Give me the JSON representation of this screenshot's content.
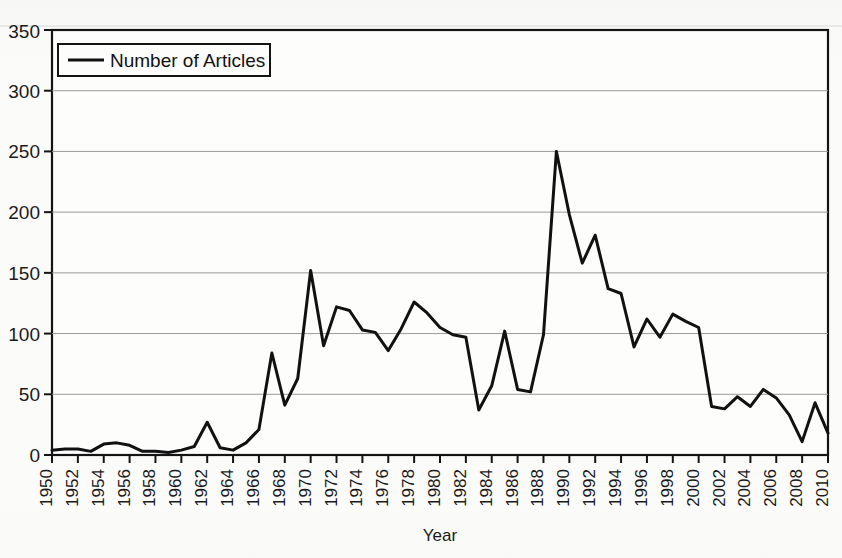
{
  "document": {
    "background_color": "#fbfbfa",
    "ink_color": "#111111",
    "gridline_color": "#9a9a9a"
  },
  "chart_data": {
    "type": "line",
    "title": "",
    "xlabel": "Year",
    "ylabel": "",
    "ylim": [
      0,
      350
    ],
    "xlim": [
      1950,
      2010
    ],
    "ytick_step": 50,
    "xtick_step": 2,
    "grid": "horizontal",
    "legend_position": "top-left-inside",
    "yticks": [
      "0",
      "50",
      "100",
      "150",
      "200",
      "250",
      "300",
      "350"
    ],
    "xticks": [
      "1950",
      "1952",
      "1954",
      "1956",
      "1958",
      "1960",
      "1962",
      "1964",
      "1966",
      "1968",
      "1970",
      "1972",
      "1974",
      "1976",
      "1978",
      "1980",
      "1982",
      "1984",
      "1986",
      "1988",
      "1990",
      "1992",
      "1994",
      "1996",
      "1998",
      "2000",
      "2002",
      "2004",
      "2006",
      "2008",
      "2010"
    ],
    "series": [
      {
        "name": "Number of Articles",
        "color": "#111111",
        "x": [
          1950,
          1951,
          1952,
          1953,
          1954,
          1955,
          1956,
          1957,
          1958,
          1959,
          1960,
          1961,
          1962,
          1963,
          1964,
          1965,
          1966,
          1967,
          1968,
          1969,
          1970,
          1971,
          1972,
          1973,
          1974,
          1975,
          1976,
          1977,
          1978,
          1979,
          1980,
          1981,
          1982,
          1983,
          1984,
          1985,
          1986,
          1987,
          1988,
          1989,
          1990,
          1991,
          1992,
          1993,
          1994,
          1995,
          1996,
          1997,
          1998,
          1999,
          2000,
          2001,
          2002,
          2003,
          2004,
          2005,
          2006,
          2007,
          2008,
          2009,
          2010
        ],
        "values": [
          4,
          5,
          5,
          3,
          9,
          10,
          8,
          3,
          3,
          2,
          4,
          7,
          27,
          6,
          4,
          10,
          21,
          84,
          41,
          63,
          152,
          90,
          122,
          119,
          103,
          101,
          86,
          104,
          126,
          117,
          105,
          99,
          97,
          37,
          57,
          102,
          54,
          52,
          99,
          250,
          198,
          158,
          181,
          137,
          133,
          89,
          112,
          97,
          116,
          110,
          105,
          40,
          38,
          48,
          40,
          54,
          47,
          33,
          11,
          43,
          18
        ]
      }
    ],
    "legend": [
      {
        "label": "Number of Articles",
        "marker": "line",
        "color": "#111111"
      }
    ]
  },
  "legend_box": {
    "label": "Number of Articles"
  },
  "axes": {
    "x_title": "Year"
  }
}
